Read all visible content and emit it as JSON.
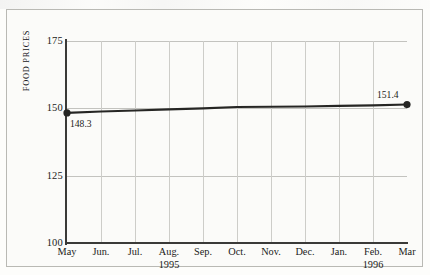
{
  "chart_data": {
    "type": "line",
    "title": "",
    "subtitle": "",
    "xlabel": "",
    "ylabel": "FOOD PRICES",
    "ylim": [
      100,
      175
    ],
    "yticks": [
      100,
      125,
      150,
      175
    ],
    "ytick_labels": [
      "100",
      "125",
      "150",
      "175"
    ],
    "grid": true,
    "legend": "none",
    "categories": [
      "May",
      "Jun.",
      "Jul.",
      "Aug.",
      "Sep.",
      "Oct.",
      "Nov.",
      "Dec.",
      "Jan.",
      "Feb.",
      "Mar"
    ],
    "year_markers": [
      {
        "label": "1995",
        "under_category": "Aug."
      },
      {
        "label": "1996",
        "under_category": "Feb."
      }
    ],
    "series": [
      {
        "name": "Food Prices",
        "color": "#262624",
        "values": [
          148.3,
          148.8,
          149.2,
          149.6,
          150.0,
          150.5,
          150.6,
          150.7,
          150.9,
          151.1,
          151.4
        ]
      }
    ],
    "point_labels": [
      {
        "category": "May",
        "value": 148.3,
        "text": "148.3",
        "position": "below-right"
      },
      {
        "category": "Mar",
        "value": 151.4,
        "text": "151.4",
        "position": "above-left"
      }
    ],
    "markers": [
      {
        "category": "May",
        "value": 148.3
      },
      {
        "category": "Mar",
        "value": 151.4
      }
    ]
  }
}
